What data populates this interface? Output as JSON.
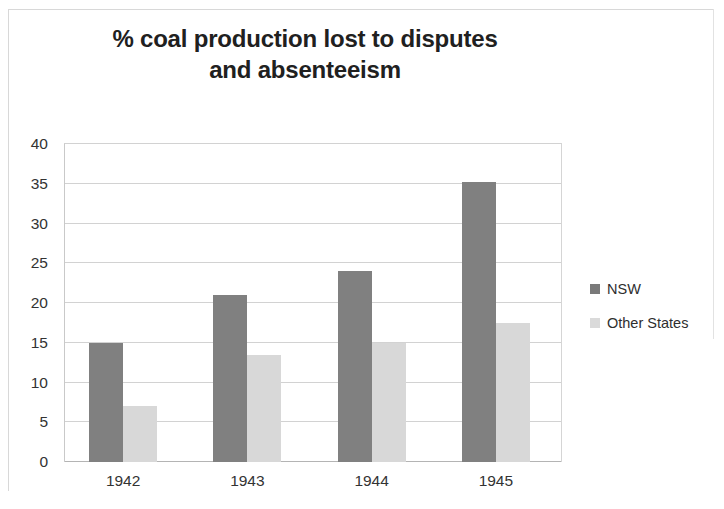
{
  "chart_data": {
    "type": "bar",
    "title": "% coal production lost to disputes and absenteeism",
    "title_line1": "% coal production lost to disputes",
    "title_line2": "and absenteeism",
    "xlabel": "",
    "ylabel": "",
    "categories": [
      "1942",
      "1943",
      "1944",
      "1945"
    ],
    "series": [
      {
        "name": "NSW",
        "color": "#808080",
        "values": [
          15,
          21,
          24,
          35.2
        ]
      },
      {
        "name": "Other States",
        "color": "#d8d8d8",
        "values": [
          7,
          13.4,
          15,
          17.5
        ]
      }
    ],
    "ylim": [
      0,
      40
    ],
    "ytick_step": 5,
    "ytick_labels": [
      "0",
      "5",
      "10",
      "15",
      "20",
      "25",
      "30",
      "35",
      "40"
    ],
    "grid": true,
    "legend_position": "right"
  },
  "legend": {
    "items": [
      {
        "label": "NSW",
        "swatch": "nsw-swatch"
      },
      {
        "label": "Other States",
        "swatch": "other-states-swatch"
      }
    ]
  }
}
